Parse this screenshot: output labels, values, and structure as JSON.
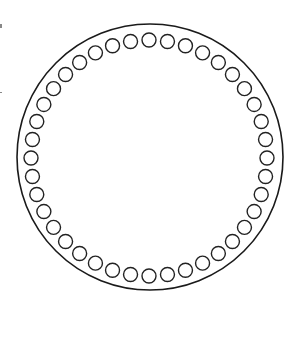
{
  "diagram": {
    "title": "",
    "outer_circle": {
      "cx": 150,
      "cy": 157,
      "r": 133,
      "stroke": "#1a1a1a",
      "stroke_width": 1.6
    },
    "inner_ring": {
      "cx": 149,
      "cy": 158,
      "r": 118,
      "count": 40,
      "small_r": 7,
      "stroke": "#222222",
      "stroke_width": 1.4
    },
    "background": "#ffffff"
  }
}
